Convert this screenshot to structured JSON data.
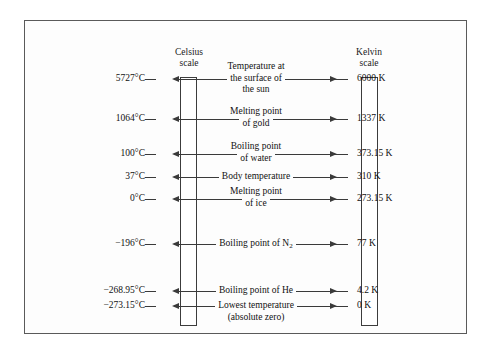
{
  "figure": {
    "type": "diagram",
    "left_scale_title_line1": "Celsius",
    "left_scale_title_line2": "scale",
    "right_scale_title_line1": "Kelvin",
    "right_scale_title_line2": "scale",
    "frame_color": "#5a5a5a",
    "ink_color": "#111111",
    "background_color": "#fdfdfd"
  },
  "rows": [
    {
      "name": "surface-of-the-sun",
      "celsius": "5727°C",
      "kelvin": "6000 K",
      "desc_lines": [
        "Temperature at",
        "the surface of",
        "the sun"
      ],
      "y": 78
    },
    {
      "name": "melting-point-of-gold",
      "celsius": "1064°C",
      "kelvin": "1337 K",
      "desc_lines": [
        "Melting point",
        "of gold"
      ],
      "y": 118
    },
    {
      "name": "boiling-point-of-water",
      "celsius": "100°C",
      "kelvin": "373.15 K",
      "desc_lines": [
        "Boiling point",
        "of water"
      ],
      "y": 153
    },
    {
      "name": "body-temperature",
      "celsius": "37°C",
      "kelvin": "310 K",
      "desc_lines": [
        "Body temperature"
      ],
      "y": 176
    },
    {
      "name": "melting-point-of-ice",
      "celsius": "0°C",
      "kelvin": "273.15 K",
      "desc_lines": [
        "Melting point",
        "of ice"
      ],
      "y": 198
    },
    {
      "name": "boiling-point-of-nitrogen",
      "celsius": "−196°C",
      "kelvin": "77 K",
      "desc_lines": [
        "Boiling point of N₂"
      ],
      "y": 243
    },
    {
      "name": "boiling-point-of-helium",
      "celsius": "−268.95°C",
      "kelvin": "4.2 K",
      "desc_lines": [
        "Boiling point of He"
      ],
      "y": 290
    },
    {
      "name": "lowest-temperature-absolute-zero",
      "celsius": "−273.15°C",
      "kelvin": "0 K",
      "desc_lines": [
        "Lowest temperature",
        "(absolute zero)"
      ],
      "y": 305,
      "desc_align": "top"
    }
  ]
}
